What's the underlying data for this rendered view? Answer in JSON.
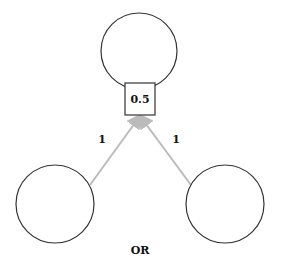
{
  "diagram": {
    "title": "OR",
    "output_node": {
      "cx": 139,
      "cy": 51,
      "r": 38
    },
    "threshold": {
      "label": "0.5",
      "x": 125,
      "y": 83,
      "w": 30,
      "h": 32
    },
    "input_nodes": [
      {
        "cx": 55,
        "cy": 204,
        "r": 39
      },
      {
        "cx": 225,
        "cy": 204,
        "r": 39
      }
    ],
    "edges": [
      {
        "x1": 90,
        "y1": 185,
        "x2": 140,
        "y2": 116,
        "weight": "1",
        "lx": 102,
        "ly": 143
      },
      {
        "x1": 191,
        "y1": 185,
        "x2": 140,
        "y2": 116,
        "weight": "1",
        "lx": 176,
        "ly": 143
      }
    ],
    "colors": {
      "node_stroke": "#333333",
      "edge": "#bbbbbb",
      "text": "#111111"
    }
  }
}
